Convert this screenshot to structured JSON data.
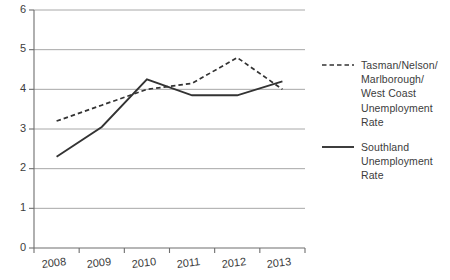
{
  "chart_data": {
    "type": "line",
    "title": "",
    "subtitle": "",
    "xlabel": "",
    "ylabel": "",
    "x": [
      "2008",
      "2009",
      "2010",
      "2011",
      "2012",
      "2013"
    ],
    "categories": [
      "2008",
      "2009",
      "2010",
      "2011",
      "2012",
      "2013"
    ],
    "xtick_labels": [
      "2008",
      "2009",
      "2010",
      "2011",
      "2012",
      "2013"
    ],
    "ytick_labels": [
      "0",
      "1",
      "2",
      "3",
      "4",
      "5",
      "6"
    ],
    "ylim": [
      0,
      6
    ],
    "ytick_step": 1,
    "grid": "horizontal",
    "legend_position": "right",
    "series": [
      {
        "name": "Tasman/Nelson/\nMarlborough/\nWest Coast\nUnemployment\nRate",
        "legend_label": "Tasman/Nelson/\nMarlborough/\nWest Coast\nUnemployment\nRate",
        "style": "dashed",
        "color": "#333333",
        "values": [
          3.2,
          3.6,
          4.0,
          4.15,
          4.8,
          4.0
        ]
      },
      {
        "name": "Southland\nUnemployment\nRate",
        "legend_label": "Southland\nUnemployment\nRate",
        "style": "solid",
        "color": "#333333",
        "values": [
          2.3,
          3.05,
          4.25,
          3.85,
          3.85,
          4.2
        ]
      }
    ]
  },
  "axes": {
    "y_axis_name": "unemployment-rate-percent",
    "x_axis_name": "year"
  }
}
